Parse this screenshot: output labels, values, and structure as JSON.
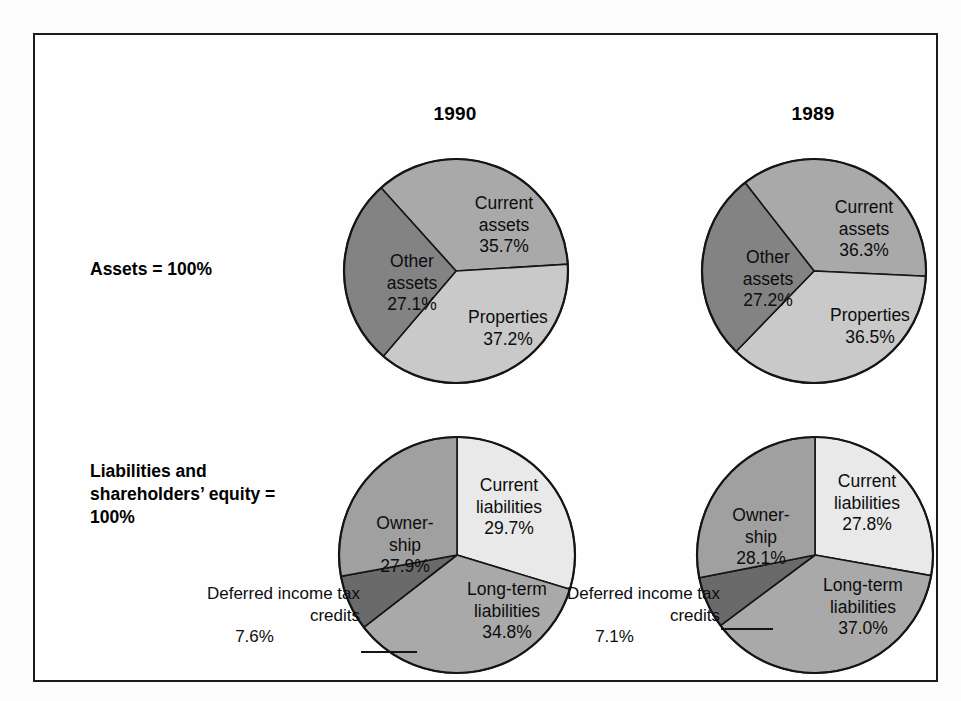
{
  "figure": {
    "frame_border_color": "#1b1b1b",
    "background": "#ffffff"
  },
  "columns": [
    {
      "id": "y1990",
      "year_label": "1990"
    },
    {
      "id": "y1989",
      "year_label": "1989"
    }
  ],
  "rows": [
    {
      "id": "assets",
      "label": "Assets = 100%"
    },
    {
      "id": "liabilities",
      "label": "Liabilities and\nshareholders’\nequity = 100%"
    }
  ],
  "callouts": [
    {
      "id": "deferred-1990",
      "text": "Deferred\nincome tax\ncredits",
      "value": "7.6%"
    },
    {
      "id": "deferred-1989",
      "text": "Deferred\nincome tax\ncredits",
      "value": "7.1%"
    }
  ],
  "palette": {
    "very_light_gray": "#e9e9e9",
    "light_gray": "#c9c9c9",
    "medium_gray": "#a9a9a9",
    "dark_gray": "#838383",
    "darkest_gray": "#6a6a6a",
    "outline": "#151515",
    "text": "#0d0d0d"
  },
  "chart_data": [
    {
      "id": "assets-1990",
      "type": "pie",
      "title": "1990",
      "group": "Assets = 100%",
      "start_angle_deg": -42,
      "radius": 112,
      "labels": [
        "Current assets",
        "Properties",
        "Other assets"
      ],
      "values": [
        35.7,
        37.2,
        27.1
      ],
      "value_labels": [
        "35.7%",
        "37.2%",
        "27.1%"
      ],
      "colors": [
        "#a9a9a9",
        "#c9c9c9",
        "#838383"
      ],
      "label_text": [
        "Current\nassets\n35.7%",
        "Properties\n37.2%",
        "Other\nassets\n27.1%"
      ],
      "label_pos": [
        [
          48,
          38
        ],
        [
          52,
          152
        ],
        [
          -44,
          96
        ]
      ]
    },
    {
      "id": "assets-1989",
      "type": "pie",
      "title": "1989",
      "group": "Assets = 100%",
      "start_angle_deg": -38,
      "radius": 112,
      "labels": [
        "Current assets",
        "Properties",
        "Other assets"
      ],
      "values": [
        36.3,
        36.5,
        27.2
      ],
      "value_labels": [
        "36.3%",
        "36.5%",
        "27.2%"
      ],
      "colors": [
        "#a9a9a9",
        "#c9c9c9",
        "#838383"
      ],
      "label_text": [
        "Current\nassets\n36.3%",
        "Properties\n36.5%",
        "Other\nassets\n27.2%"
      ],
      "label_pos": [
        [
          50,
          42
        ],
        [
          56,
          150
        ],
        [
          -46,
          92
        ]
      ]
    },
    {
      "id": "liabilities-1990",
      "type": "pie",
      "title": "1990",
      "group": "Liabilities and shareholders’ equity = 100%",
      "start_angle_deg": 0,
      "radius": 118,
      "labels": [
        "Current liabilities",
        "Long-term liabilities",
        "Deferred income tax credits",
        "Ownership"
      ],
      "values": [
        29.7,
        34.8,
        7.6,
        27.9
      ],
      "value_labels": [
        "29.7%",
        "34.8%",
        "7.6%",
        "27.9%"
      ],
      "colors": [
        "#e9e9e9",
        "#a9a9a9",
        "#6a6a6a",
        "#a0a0a0"
      ],
      "label_text": [
        "Current\nliabilities\n29.7%",
        "Long-term\nliabilities\n34.8%",
        "",
        "Owner-\nship\n27.9%"
      ],
      "label_pos": [
        [
          52,
          42
        ],
        [
          50,
          146
        ],
        [
          0,
          0
        ],
        [
          -52,
          80
        ]
      ]
    },
    {
      "id": "liabilities-1989",
      "type": "pie",
      "title": "1989",
      "group": "Liabilities and shareholders’ equity = 100%",
      "start_angle_deg": 0,
      "radius": 118,
      "labels": [
        "Current liabilities",
        "Long-term liabilities",
        "Deferred income tax credits",
        "Ownership"
      ],
      "values": [
        27.8,
        37.0,
        7.1,
        28.1
      ],
      "value_labels": [
        "27.8%",
        "37.0%",
        "7.1%",
        "28.1%"
      ],
      "colors": [
        "#e9e9e9",
        "#a9a9a9",
        "#6a6a6a",
        "#a0a0a0"
      ],
      "label_text": [
        "Current\nliabilities\n27.8%",
        "Long-term\nliabilities\n37.0%",
        "",
        "Owner-\nship\n28.1%"
      ],
      "label_pos": [
        [
          52,
          38
        ],
        [
          48,
          142
        ],
        [
          0,
          0
        ],
        [
          -54,
          72
        ]
      ]
    }
  ]
}
